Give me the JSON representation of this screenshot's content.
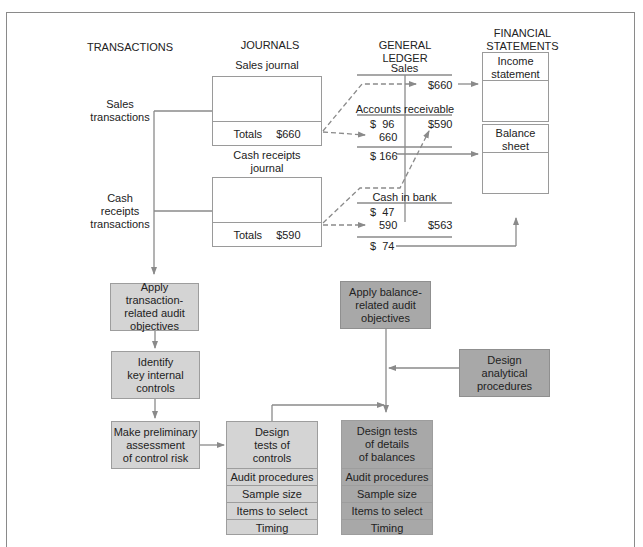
{
  "columns": {
    "transactions": "TRANSACTIONS",
    "journals": "JOURNALS",
    "general_ledger": "GENERAL LEDGER",
    "financial_statements_line1": "FINANCIAL",
    "financial_statements_line2": "STATEMENTS"
  },
  "transactions": {
    "sales": [
      "Sales",
      "transactions"
    ],
    "cash": [
      "Cash",
      "receipts",
      "transactions"
    ]
  },
  "journals": {
    "sales": {
      "title": "Sales journal",
      "totals_label": "Totals",
      "totals_value": "$660"
    },
    "cash": {
      "title_line1": "Cash receipts",
      "title_line2": "journal",
      "totals_label": "Totals",
      "totals_value": "$590"
    }
  },
  "ledger": {
    "sales": {
      "title": "Sales",
      "credit": "$660"
    },
    "accounts_receivable": {
      "title": "Accounts receivable",
      "debit1": "$  96",
      "debit2": "660",
      "credit": "$590",
      "balance": "$ 166"
    },
    "cash_in_bank": {
      "title": "Cash in bank",
      "debit1": "$  47",
      "debit2": "590",
      "credit": "$563",
      "balance": "$  74"
    }
  },
  "statements": {
    "income": [
      "Income",
      "statement"
    ],
    "balance": [
      "Balance",
      "sheet"
    ]
  },
  "flow": {
    "apply_transaction": [
      "Apply transaction-",
      "related audit",
      "objectives"
    ],
    "identify_controls": [
      "Identify",
      "key internal",
      "controls"
    ],
    "preliminary_assessment": [
      "Make preliminary",
      "assessment",
      "of control risk"
    ],
    "design_tests_controls": {
      "title": [
        "Design",
        "tests of",
        "controls"
      ],
      "rows": [
        "Audit procedures",
        "Sample size",
        "Items to select",
        "Timing"
      ]
    },
    "apply_balance": [
      "Apply balance-",
      "related audit",
      "objectives"
    ],
    "design_analytical": [
      "Design",
      "analytical",
      "procedures"
    ],
    "design_tests_details": {
      "title": [
        "Design tests",
        "of details",
        "of balances"
      ],
      "rows": [
        "Audit procedures",
        "Sample size",
        "Items to select",
        "Timing"
      ]
    }
  },
  "colors": {
    "light_box": "#d4d4d4",
    "dark_box": "#a8a8a8",
    "line": "#8a8a8a"
  }
}
